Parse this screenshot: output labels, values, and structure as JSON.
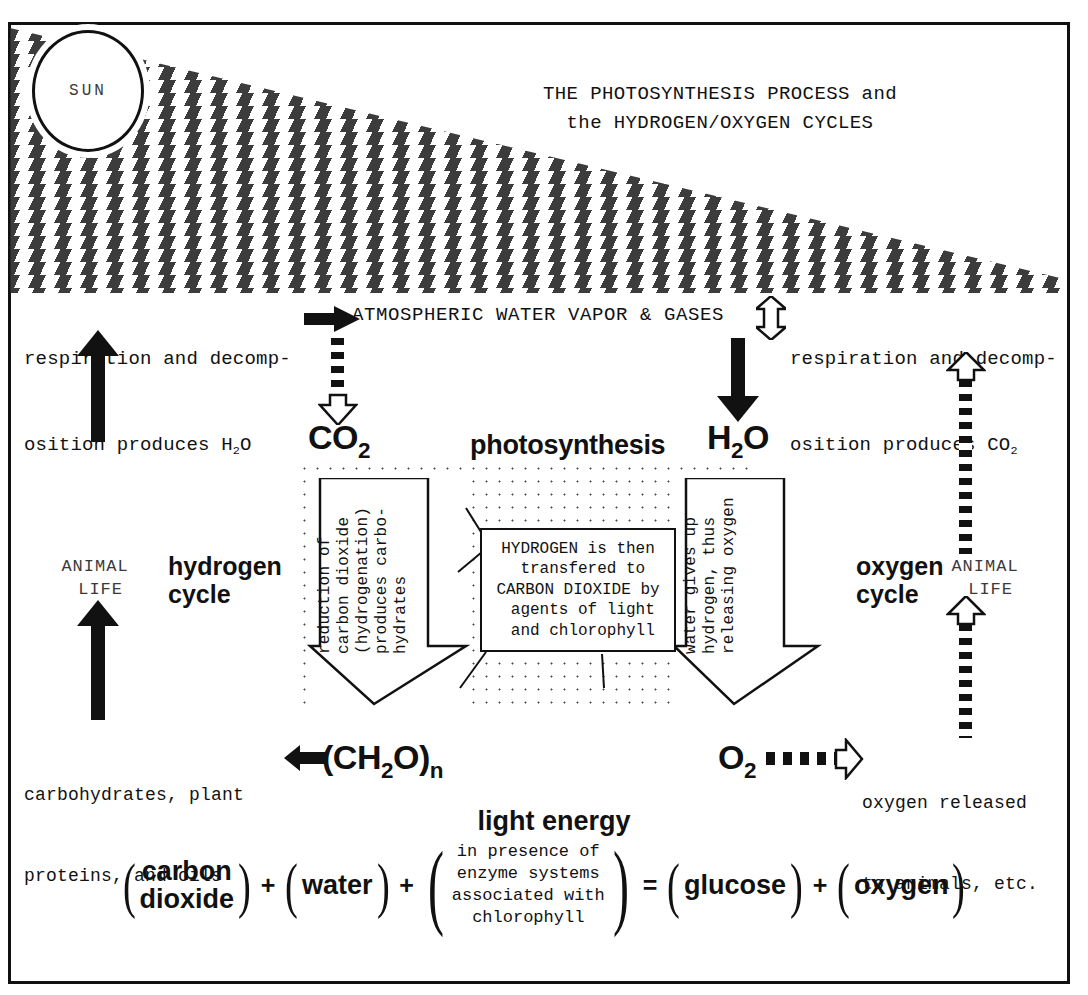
{
  "title": "PHOTOSYNTHESIS",
  "sun": {
    "label": "SUN"
  },
  "header": {
    "line1": "THE PHOTOSYNTHESIS PROCESS and",
    "line2": "the HYDROGEN/OXYGEN CYCLES"
  },
  "atmosphere": {
    "band_label": "ATMOSPHERIC WATER VAPOR & GASES",
    "resp_left_line1": "respiration and decomp-",
    "resp_left_line2": "osition produces H",
    "resp_left_sub": "2",
    "resp_left_tail": "O",
    "resp_right_line1": "respiration and decomp-",
    "resp_right_line2": "osition produces CO",
    "resp_right_sub": "2"
  },
  "molecules": {
    "co2": {
      "main": "CO",
      "sub": "2"
    },
    "h2o": {
      "main": "H",
      "sub": "2",
      "tail": "O"
    },
    "o2": {
      "main": "O",
      "sub": "2"
    },
    "ch2o": {
      "open": "(",
      "main_a": "CH",
      "sub_a": "2",
      "main_b": "O",
      "close": ")",
      "sub_n": "n"
    }
  },
  "photosynthesis_word": "photosynthesis",
  "left_arrow_text": "reduction of\ncarbon dioxide\n(hydrogenation)\nproduces carbo-\nhydrates",
  "right_arrow_text": "water gives up\nhydrogen, thus\nreleasing oxygen",
  "callout_text": "HYDROGEN is then\n transfered to\nCARBON DIOXIDE by\n agents of light\n and chlorophyll",
  "cycles": {
    "hydrogen": "hydrogen\ncycle",
    "oxygen": "oxygen\ncycle",
    "animal_life_left": "ANIMAL\n LIFE",
    "animal_life_right": "ANIMAL\n LIFE"
  },
  "products": {
    "left_caption_line1": "carbohydrates, plant",
    "left_caption_line2": "proteins, and oils",
    "right_caption_line1": "oxygen released",
    "right_caption_line2": "to animals, etc."
  },
  "equation": {
    "light_energy": "light energy",
    "term1": {
      "line1": "carbon",
      "line2": "dioxide"
    },
    "op1": "+",
    "term2": {
      "line1": "water"
    },
    "op2": "+",
    "term3": {
      "line1": "in presence of",
      "line2": "enzyme systems",
      "line3": "associated with",
      "line4": "chlorophyll"
    },
    "op3": "=",
    "term4": {
      "line1": "glucose"
    },
    "op4": "+",
    "term5": {
      "line1": "oxygen"
    }
  },
  "colors": {
    "ink": "#111111",
    "paper": "#ffffff",
    "muted": "#3a3a3a"
  }
}
